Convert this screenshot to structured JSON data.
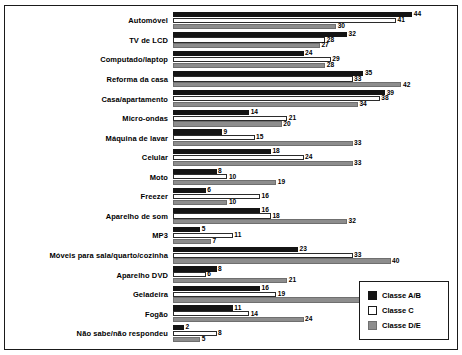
{
  "chart_data": {
    "type": "bar",
    "orientation": "horizontal",
    "title": "",
    "subtitle": "",
    "xlabel": "",
    "ylabel": "",
    "xlim": [
      0,
      50
    ],
    "grid": false,
    "legend_position": "bottom-right",
    "categories": [
      "Automóvel",
      "TV de LCD",
      "Computado/laptop",
      "Reforma da casa",
      "Casa/apartamento",
      "Micro-ondas",
      "Máquina de lavar",
      "Celular",
      "Moto",
      "Freezer",
      "Aparelho de som",
      "MP3",
      "Móveis para sala/quarto/cozinha",
      "Aparelho DVD",
      "Geladeira",
      "Fogão",
      "Não sabe/não respondeu"
    ],
    "series": [
      {
        "name": "Classe A/B",
        "color": "#141414",
        "values": [
          44,
          32,
          24,
          35,
          39,
          14,
          9,
          18,
          8,
          6,
          16,
          5,
          23,
          8,
          16,
          11,
          2
        ]
      },
      {
        "name": "Classe C",
        "color": "#ffffff",
        "values": [
          41,
          28,
          29,
          33,
          38,
          21,
          15,
          24,
          10,
          16,
          18,
          11,
          33,
          6,
          19,
          14,
          8
        ]
      },
      {
        "name": "Classe D/E",
        "color": "#8d8d8d",
        "values": [
          30,
          27,
          28,
          42,
          34,
          20,
          33,
          33,
          19,
          10,
          32,
          7,
          40,
          21,
          35,
          24,
          5
        ]
      }
    ]
  },
  "legend": {
    "items": [
      {
        "label": "Classe A/B",
        "swatch": "ab"
      },
      {
        "label": "Classe C",
        "swatch": "c"
      },
      {
        "label": "Classe D/E",
        "swatch": "de"
      }
    ]
  }
}
